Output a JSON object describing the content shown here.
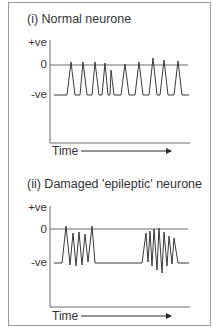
{
  "figure": {
    "panels": [
      {
        "title": "(i) Normal neurone",
        "y_labels": {
          "top": "+ve",
          "zero": "0",
          "bottom": "-ve"
        },
        "x_label": "Time",
        "description": "Regular, well-separated action potential spikes rising from resting (-ve) to about 0"
      },
      {
        "title": "(ii) Damaged 'epileptic' neurone",
        "y_labels": {
          "top": "+ve",
          "zero": "0",
          "bottom": "-ve"
        },
        "x_label": "Time",
        "description": "Two bursts of rapid, irregular high-frequency spikes separated by a quiet period"
      }
    ],
    "colors": {
      "trace": "#3a3a3a",
      "axis": "#6a6a6a",
      "frame": "#9a9a9a"
    }
  }
}
